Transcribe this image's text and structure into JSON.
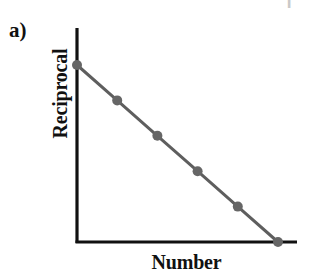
{
  "panel": {
    "label": "a)"
  },
  "artifact": {
    "glyph": "I"
  },
  "colors": {
    "axis": "#111111",
    "line": "#5e5e5e",
    "marker": "#666666",
    "background": "#ffffff",
    "text": "#111111"
  },
  "chart_data": {
    "type": "line",
    "title": "",
    "subtitle": "",
    "xlabel": "Number",
    "ylabel": "Reciprocal",
    "grid": false,
    "legend": false,
    "legend_position": "none",
    "axis_ticks": false,
    "tick_labels": {
      "x": [],
      "y": []
    },
    "xlim": [
      0,
      6
    ],
    "ylim": [
      0,
      6
    ],
    "annotations": [
      "a)"
    ],
    "series": [
      {
        "name": "Reciprocal vs Number",
        "marker": "circle",
        "x": [
          0,
          1,
          2,
          3,
          4,
          5
        ],
        "y": [
          5,
          4,
          3,
          2,
          1,
          0
        ]
      }
    ]
  }
}
